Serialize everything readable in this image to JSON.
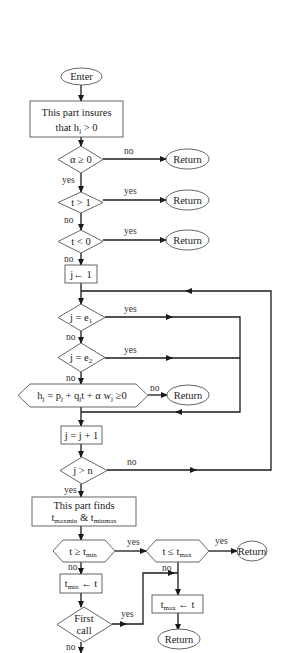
{
  "diagram": {
    "type": "flowchart",
    "nodes": {
      "enter": {
        "label": "Enter"
      },
      "insure_box": {
        "line1": "This part insures",
        "line2_prefix": "that h",
        "line2_sub": "j",
        "line2_suffix": " > 0"
      },
      "alpha_check": {
        "label": "α ≥ 0"
      },
      "t_gt_1": {
        "label": "t > 1"
      },
      "t_lt_0": {
        "label": "t < 0"
      },
      "j_init": {
        "label": "j← 1"
      },
      "j_eq_e1": {
        "prefix": "j = e",
        "sub": "1"
      },
      "j_eq_e2": {
        "prefix": "j = e",
        "sub": "2"
      },
      "h_check": {
        "p1": "h",
        "s1": "j",
        "p2": " = p",
        "s2": "j",
        "p3": " + q",
        "s3": "j",
        "p4": "t + α w",
        "s4": "j",
        "p5": " ≥0"
      },
      "j_incr": {
        "label": "j =  j + 1"
      },
      "j_gt_n": {
        "label": "j > n"
      },
      "finds_box": {
        "line1": "This part finds",
        "t1": "t",
        "t1_sub": "maxmin",
        "amp": " & ",
        "t2": "t",
        "t2_sub": "minmax"
      },
      "t_ge_tmin": {
        "prefix": "t ≥ t",
        "sub": "min"
      },
      "t_le_tmax": {
        "prefix": "t ≤ t",
        "sub": "max"
      },
      "tmin_assign": {
        "prefix": "t",
        "sub": "min",
        "suffix": " ← t"
      },
      "first_call": {
        "line1": "First",
        "line2": "call"
      },
      "tmax_assign": {
        "prefix": "t",
        "sub": "max",
        "suffix": " ← t"
      },
      "return_1": {
        "label": "Return"
      },
      "return_2": {
        "label": "Return"
      },
      "return_3": {
        "label": "Return"
      },
      "return_4": {
        "label": "Return"
      },
      "return_5": {
        "label": "Return"
      },
      "return_6": {
        "label": "Return"
      }
    },
    "edge_labels": {
      "alpha_no": "no",
      "alpha_yes": "yes",
      "t1_yes": "yes",
      "t1_no": "no",
      "t0_yes": "yes",
      "t0_no": "no",
      "e1_yes": "yes",
      "e1_no": "no",
      "e2_yes": "yes",
      "e2_no": "no",
      "h_no": "no",
      "jn_no": "no",
      "jn_yes": "yes",
      "tmin_yes": "yes",
      "tmin_no": "no",
      "tmax_yes": "yes",
      "tmax_no": "no",
      "first_yes": "yes",
      "first_no": "no"
    },
    "colors": {
      "stroke": "#555555",
      "line": "#1a1a1a",
      "text": "#222222",
      "background": "#ffffff"
    }
  }
}
